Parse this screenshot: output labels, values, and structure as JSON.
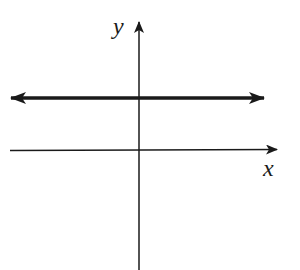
{
  "diagram": {
    "type": "coordinate-plane",
    "axes": {
      "x_label": "x",
      "y_label": "y"
    },
    "lines": [
      {
        "description": "horizontal line above x-axis, extending infinitely both directions",
        "orientation": "horizontal",
        "arrows": "both-ends"
      }
    ],
    "colors": {
      "stroke": "#1a1a1a",
      "background": "#ffffff"
    }
  }
}
